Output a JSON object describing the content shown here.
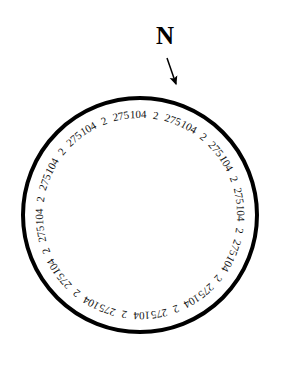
{
  "figure": {
    "type": "compass-dial",
    "background_color": "#ffffff",
    "ink_color": "#000000"
  },
  "north_marker": {
    "label": "N",
    "arrow_from": [
      167,
      58
    ],
    "arrow_to": [
      176,
      86
    ]
  },
  "dial": {
    "center_x": 140,
    "center_y": 215,
    "radius": 117,
    "stroke_width": 4,
    "stroke_color": "#000000",
    "fill_color": "#ffffff",
    "label_radius": 101,
    "label_count": 36,
    "start_angle_deg": -101,
    "repeating_sequence": [
      "275",
      "104",
      "2"
    ],
    "labels": [
      "275",
      "104",
      "2",
      "275",
      "104",
      "2",
      "275",
      "104",
      "2",
      "275",
      "104",
      "2",
      "275",
      "104",
      "2",
      "275",
      "104",
      "2",
      "275",
      "104",
      "2",
      "275",
      "104",
      "2",
      "275",
      "104",
      "2",
      "275",
      "104",
      "2",
      "275",
      "104",
      "2",
      "275",
      "104",
      "2"
    ]
  }
}
